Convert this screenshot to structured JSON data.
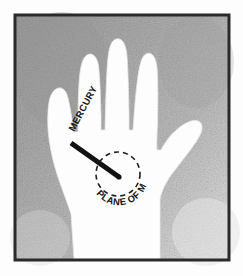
{
  "figure": {
    "kind": "palmistry-diagram",
    "caption": "",
    "frame": {
      "border_color": "#2a2a2a",
      "border_width_px": 3,
      "inset_px": 14,
      "outer_margin_color": "#fdfdfd"
    },
    "background": {
      "base_color": "#a8a8a8",
      "light_color": "#d6d6d6",
      "dark_color": "#8e8e8e",
      "texture": "halftone-speckle",
      "description": "mottled gray scanned halftone paper tone"
    },
    "hand": {
      "name": "left-hand-palm-silhouette",
      "fill_color": "#fdfdfd",
      "edge_color": "#e2e2e2",
      "orientation": "palm facing viewer, fingers up",
      "finger_count": 4,
      "thumb": "extends to the right"
    },
    "labels": {
      "mercury": {
        "text": "MERCURY",
        "rotation_deg": -62,
        "x": 74,
        "y": 132,
        "font_size_px": 9.5,
        "letter_spacing_px": 0.3,
        "color": "#141414",
        "target": "index-finger"
      },
      "plane_of_mars": {
        "text": "PLANE OF MARS",
        "layout": "arc-along-circle-bottom",
        "font_size_px": 9.5,
        "color": "#141414",
        "arc_start_deg": 128,
        "arc_sweep_deg": 122
      }
    },
    "line_of_mercury": {
      "name": "mercury-line",
      "x1": 71,
      "y1": 143,
      "x2": 119,
      "y2": 177,
      "stroke_width_px": 5.2,
      "color": "#121212"
    },
    "plane_circle": {
      "name": "plane-of-mars-circle",
      "cx": 118,
      "cy": 174,
      "r": 22,
      "stroke_width_px": 1.6,
      "dash_pattern": "5 4",
      "color": "#1d1d1d"
    },
    "center_dot": {
      "cx": 119,
      "cy": 177,
      "r": 2.6,
      "color": "#121212"
    }
  }
}
